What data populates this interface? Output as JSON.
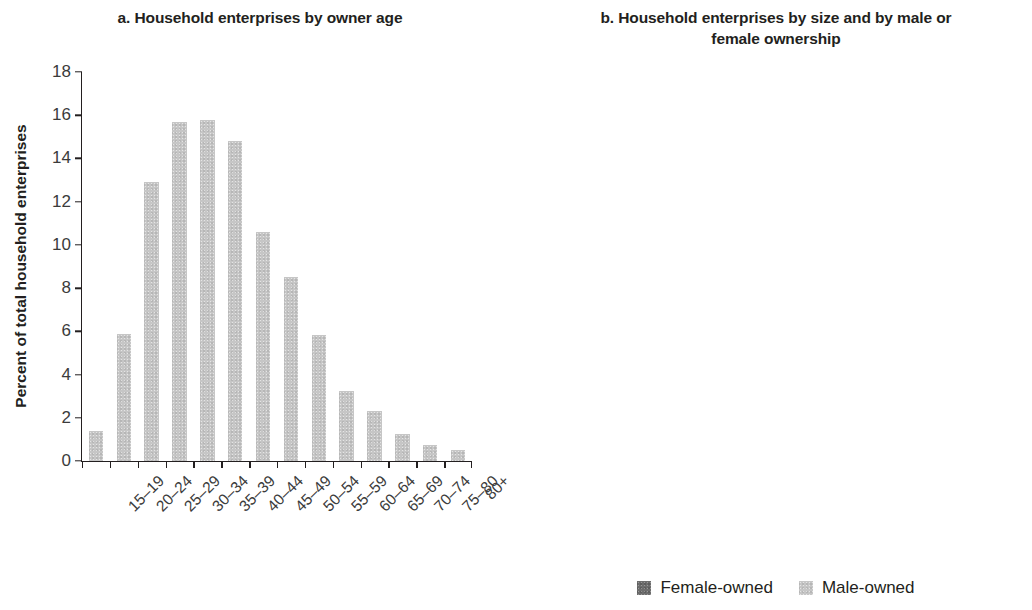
{
  "chart_data": [
    {
      "type": "bar",
      "panel": "a",
      "title": "a. Household enterprises by owner age",
      "xlabel": "",
      "ylabel": "Percent of total household enterprises",
      "ylim": [
        0,
        18
      ],
      "yticks": [
        0,
        2,
        4,
        6,
        8,
        10,
        12,
        14,
        16,
        18
      ],
      "grid": false,
      "legend": "none",
      "bar_color": "#c6c6c6",
      "categories": [
        "15–19",
        "20–24",
        "25–29",
        "30–34",
        "35–39",
        "40–44",
        "45–49",
        "50–54",
        "55–59",
        "60–64",
        "65–69",
        "70–74",
        "75–80",
        "80+"
      ],
      "values": [
        1.4,
        5.9,
        12.9,
        15.7,
        15.8,
        14.8,
        10.6,
        8.5,
        5.85,
        3.25,
        2.3,
        1.25,
        0.75,
        0.5
      ]
    },
    {
      "type": "bar",
      "panel": "b",
      "stacked": true,
      "title": "b. Household enterprises by size and by male or female ownership",
      "xlabel": "",
      "ylabel": "Percent",
      "ylim": [
        0,
        100
      ],
      "yticks": [
        0,
        10,
        20,
        30,
        40,
        50,
        60,
        70,
        80,
        90,
        100
      ],
      "grid": false,
      "legend_position": "bottom",
      "categories": [
        "Own account",
        "2 workers",
        "3–5 workers",
        "5+ workers"
      ],
      "series": [
        {
          "name": "Male-owned",
          "color": "#c6c6c6",
          "values": [
            26,
            36,
            40.5,
            63
          ]
        },
        {
          "name": "Female-owned",
          "color": "#6d6d6d",
          "values": [
            74,
            64,
            59.5,
            37
          ]
        }
      ]
    }
  ],
  "panel_a": {
    "title": "a. Household enterprises by owner age",
    "y_axis_title": "Percent of total household enterprises"
  },
  "panel_b": {
    "title": "b. Household enterprises by size and by male or female ownership",
    "y_axis_title": "Percent"
  },
  "legend": {
    "items": [
      {
        "label": "Female-owned",
        "color": "#6d6d6d"
      },
      {
        "label": "Male-owned",
        "color": "#c6c6c6"
      }
    ]
  }
}
